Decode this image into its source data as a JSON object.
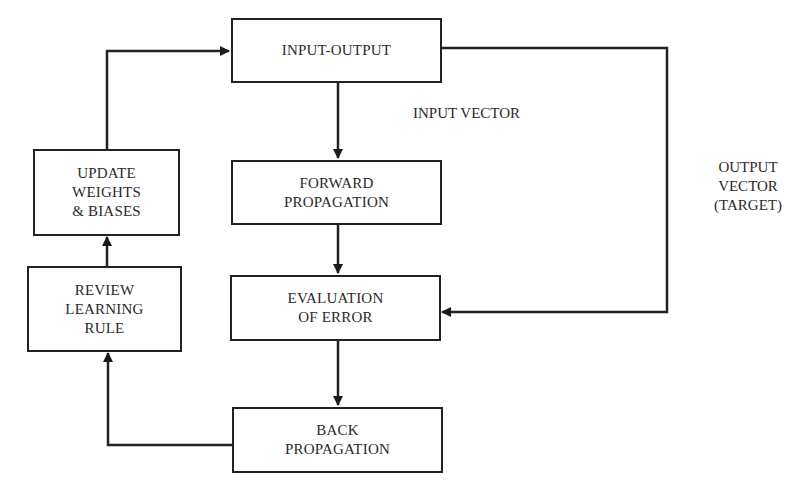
{
  "diagram": {
    "nodes": {
      "input_output": {
        "label": "INPUT-OUTPUT"
      },
      "forward_propagation": {
        "line1": "FORWARD",
        "line2": "PROPAGATION"
      },
      "evaluation_of_error": {
        "line1": "EVALUATION",
        "line2": "OF ERROR"
      },
      "back_propagation": {
        "line1": "BACK",
        "line2": "PROPAGATION"
      },
      "update_weights": {
        "line1": "UPDATE",
        "line2": "WEIGHTS",
        "line3": "& BIASES"
      },
      "review_learning_rule": {
        "line1": "REVIEW",
        "line2": "LEARNING",
        "line3": "RULE"
      }
    },
    "labels": {
      "input_vector": "INPUT VECTOR",
      "output_vector": {
        "line1": "OUTPUT",
        "line2": "VECTOR",
        "line3": "(TARGET)"
      }
    },
    "edges": [
      {
        "from": "INPUT-OUTPUT",
        "to": "FORWARD PROPAGATION"
      },
      {
        "from": "FORWARD PROPAGATION",
        "to": "EVALUATION OF ERROR"
      },
      {
        "from": "INPUT-OUTPUT",
        "to": "EVALUATION OF ERROR",
        "label": "OUTPUT VECTOR (TARGET)"
      },
      {
        "from": "EVALUATION OF ERROR",
        "to": "BACK PROPAGATION"
      },
      {
        "from": "BACK PROPAGATION",
        "to": "REVIEW LEARNING RULE"
      },
      {
        "from": "REVIEW LEARNING RULE",
        "to": "UPDATE WEIGHTS & BIASES"
      },
      {
        "from": "UPDATE WEIGHTS & BIASES",
        "to": "INPUT-OUTPUT"
      }
    ],
    "colors": {
      "stroke": "#222222",
      "text": "#2a2a2a",
      "background": "#ffffff"
    }
  }
}
